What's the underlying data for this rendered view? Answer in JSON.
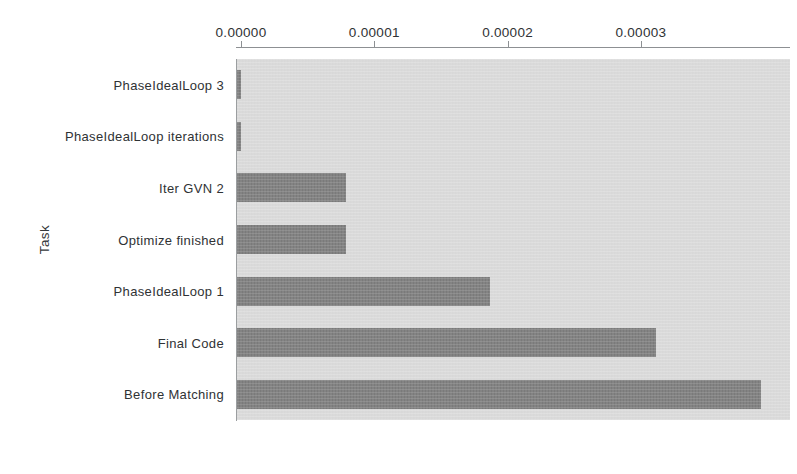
{
  "chart_data": {
    "type": "bar",
    "orientation": "horizontal",
    "title": "",
    "xlabel": "",
    "ylabel": "Task",
    "categories": [
      "PhaseIdealLoop 3",
      "PhaseIdealLoop iterations",
      "Iter GVN 2",
      "Optimize finished",
      "PhaseIdealLoop 1",
      "Final Code",
      "Before Matching"
    ],
    "values": [
      0.0,
      0.0,
      7.9e-06,
      7.9e-06,
      1.87e-05,
      3.11e-05,
      3.9e-05
    ],
    "xlim": [
      0.0,
      4.16e-05
    ],
    "ylim_categories": 7,
    "xticks": [
      0.0,
      1e-05,
      2e-05,
      3e-05
    ],
    "xticklabels": [
      "0.00000",
      "0.00001",
      "0.00002",
      "0.00003"
    ],
    "grid": false,
    "legend": null,
    "x_axis_position": "top",
    "colors": {
      "bar": "#7d7d7d",
      "plot_background": "#dcdcdc",
      "axis_line": "#8d9093",
      "text": "#2f3234",
      "figure_background": "#ffffff"
    }
  },
  "axes": {
    "y_title": "Task"
  }
}
